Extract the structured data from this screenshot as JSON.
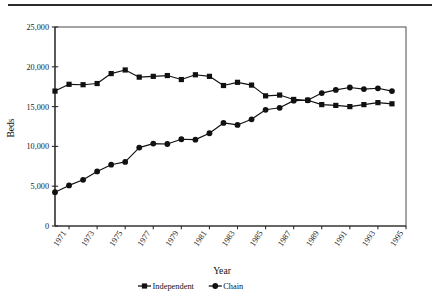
{
  "chart_data": {
    "type": "line",
    "title": "",
    "xlabel": "Year",
    "ylabel": "Beds",
    "x": [
      1970,
      1971,
      1972,
      1973,
      1974,
      1975,
      1976,
      1977,
      1978,
      1979,
      1980,
      1981,
      1982,
      1983,
      1984,
      1985,
      1986,
      1987,
      1988,
      1989,
      1990,
      1991,
      1992,
      1993,
      1994
    ],
    "xtick_labels": [
      "1971",
      "1973",
      "1975",
      "1977",
      "1979",
      "1981",
      "1983",
      "1985",
      "1987",
      "1989",
      "1991",
      "1993",
      "1995"
    ],
    "xtick_values": [
      1971,
      1973,
      1975,
      1977,
      1979,
      1981,
      1983,
      1985,
      1987,
      1989,
      1991,
      1993,
      1995
    ],
    "ytick_labels": [
      "0",
      "5,000",
      "10,000",
      "15,000",
      "20,000",
      "25,000"
    ],
    "ytick_values": [
      0,
      5000,
      10000,
      15000,
      20000,
      25000
    ],
    "ylim": [
      0,
      25000
    ],
    "xlim": [
      1970,
      1995
    ],
    "grid": false,
    "legend_position": "bottom-center",
    "series": [
      {
        "name": "Independent",
        "marker": "square",
        "color": "#111111",
        "values": [
          16950,
          17800,
          17750,
          17900,
          19150,
          19600,
          18700,
          18800,
          18900,
          18400,
          19000,
          18800,
          17650,
          18050,
          17700,
          16350,
          16450,
          15900,
          15800,
          15250,
          15150,
          15000,
          15250,
          15500,
          15350
        ]
      },
      {
        "name": "Chain",
        "marker": "circle",
        "color": "#111111",
        "values": [
          4250,
          5100,
          5800,
          6850,
          7700,
          8050,
          9850,
          10350,
          10300,
          10900,
          10850,
          11650,
          12950,
          12700,
          13400,
          14600,
          14850,
          15750,
          15800,
          16700,
          17100,
          17400,
          17200,
          17300,
          16950
        ]
      }
    ]
  },
  "legend": {
    "items": [
      {
        "label": "Independent",
        "marker": "square"
      },
      {
        "label": "Chain",
        "marker": "circle"
      }
    ]
  }
}
